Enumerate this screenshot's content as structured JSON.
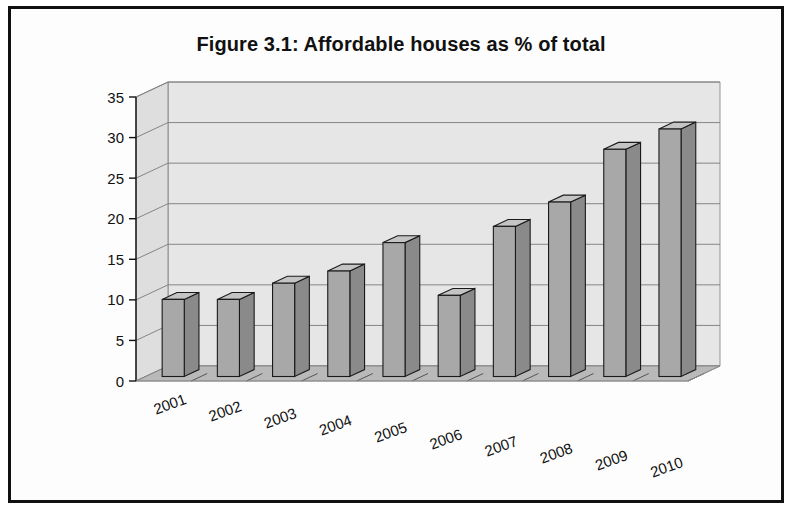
{
  "document": {
    "figure_label": "Figure 3.1",
    "title": "Figure 3.1: Affordable houses as % of total"
  },
  "chart_data": {
    "type": "bar",
    "title": "Figure 3.1: Affordable houses as % of total",
    "xlabel": "",
    "ylabel": "",
    "categories": [
      "2001",
      "2002",
      "2003",
      "2004",
      "2005",
      "2006",
      "2007",
      "2008",
      "2009",
      "2010"
    ],
    "values": [
      9.5,
      9.5,
      11.5,
      13,
      16.5,
      10,
      18.5,
      21.5,
      28,
      30.5
    ],
    "ylim": [
      0,
      35
    ],
    "yticks": [
      0,
      5,
      10,
      15,
      20,
      25,
      30,
      35
    ],
    "ytick_labels": [
      "0",
      "5",
      "10",
      "15",
      "20",
      "25",
      "30",
      "35"
    ],
    "grid": true,
    "legend": false,
    "legend_position": "none",
    "three_d": true,
    "colors": {
      "bar_front": "#a8a8a8",
      "bar_side": "#8a8a8a",
      "bar_top": "#c4c4c4",
      "bar_outline": "#1a1a1a",
      "wall_back": "#e6e6e6",
      "wall_left": "#dedede",
      "floor": "#b9b9b9",
      "gridline": "#7b7b7b",
      "text": "#111111",
      "page_border": "#101010"
    }
  }
}
